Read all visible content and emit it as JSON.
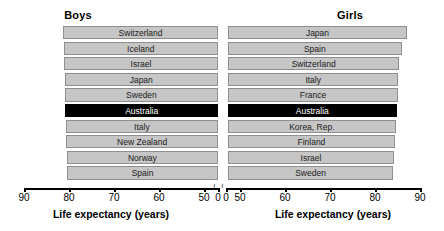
{
  "chart_data": {
    "type": "bar",
    "title": "",
    "orientation": "horizontal",
    "layout": "back-to-back mirrored panels",
    "grid": false,
    "legend": null,
    "panels": [
      {
        "name": "boys",
        "title": "Boys",
        "xlabel": "Life expectancy (years)",
        "axis_direction": "reversed",
        "xlim": [
          90,
          50
        ],
        "axis_break_at": 0,
        "ticks": [
          90,
          80,
          70,
          60,
          50,
          0
        ],
        "tick_labels": [
          "90",
          "80",
          "70",
          "60",
          "50",
          "0"
        ],
        "baseline": 50,
        "categories": [
          "Switzerland",
          "Iceland",
          "Israel",
          "Japan",
          "Sweden",
          "Australia",
          "Italy",
          "New Zealand",
          "Norway",
          "Spain"
        ],
        "values": [
          81.3,
          81.2,
          81.1,
          81.0,
          80.9,
          80.8,
          80.7,
          80.6,
          80.5,
          80.4
        ],
        "highlight": "Australia"
      },
      {
        "name": "girls",
        "title": "Girls",
        "xlabel": "Life expectancy (years)",
        "axis_direction": "normal",
        "xlim": [
          50,
          90
        ],
        "axis_break_at": 0,
        "ticks": [
          0,
          50,
          60,
          70,
          80,
          90
        ],
        "tick_labels": [
          "0",
          "50",
          "60",
          "70",
          "80",
          "90"
        ],
        "baseline": 50,
        "categories": [
          "Japan",
          "Spain",
          "Switzerland",
          "Italy",
          "France",
          "Australia",
          "Korea, Rep.",
          "Finland",
          "Israel",
          "Sweden"
        ],
        "values": [
          87.1,
          85.9,
          85.4,
          85.2,
          85.1,
          84.8,
          84.6,
          84.4,
          84.2,
          84.0
        ],
        "highlight": "Australia"
      }
    ]
  },
  "axis_break_glyph": "≀"
}
